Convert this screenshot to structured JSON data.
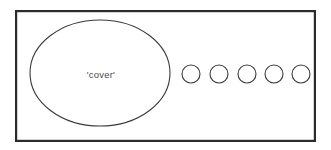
{
  "figure": {
    "background_color": "#ffffff",
    "frame": {
      "name": "universe-rectangle",
      "x": 15,
      "y": 10,
      "width": 301,
      "height": 132,
      "stroke_color": "#2b2b2b",
      "stroke_width": 2.2,
      "fill_color": "#ffffff"
    },
    "cover_set": {
      "name": "cover-ellipse",
      "label": "'cover'",
      "cx": 100,
      "cy": 73,
      "rx": 70,
      "ry": 53,
      "stroke_color": "#3a3a3a",
      "stroke_width": 1.1,
      "fill_color": "#ffffff",
      "label_x": 101,
      "label_y": 75,
      "label_color": "#4a4a4a",
      "label_font_size": 9.5
    },
    "small_circles": {
      "name": "element-circles",
      "count": 5,
      "radius": 9,
      "cy": 74,
      "stroke_color": "#3a3a3a",
      "stroke_width": 1.1,
      "fill_color": "#ffffff",
      "items": [
        {
          "index": 1,
          "cx": 191
        },
        {
          "index": 2,
          "cx": 219
        },
        {
          "index": 3,
          "cx": 247
        },
        {
          "index": 4,
          "cx": 274
        },
        {
          "index": 5,
          "cx": 301
        }
      ]
    }
  }
}
